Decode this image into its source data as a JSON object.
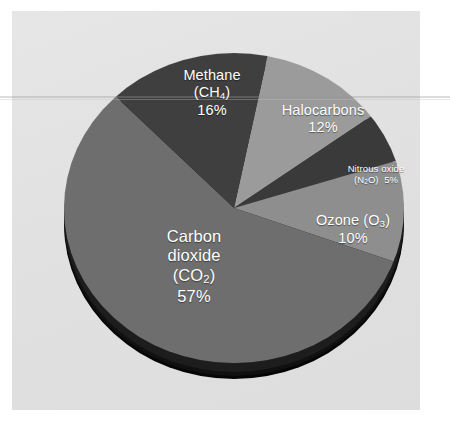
{
  "figure": {
    "background_panel_color": "#e3e3e3",
    "page_color": "#ffffff"
  },
  "chart_data": {
    "type": "pie",
    "title": "",
    "subtitle": "",
    "xlabel": "",
    "ylabel": "",
    "legend_position": "none",
    "grid": false,
    "style": "3d-pie-with-depth",
    "categories": [
      "Halocarbons",
      "Nitrous oxide (N2O)",
      "Ozone (O3)",
      "Carbon dioxide (CO2)",
      "Methane (CH4)"
    ],
    "values": [
      12,
      5,
      10,
      57,
      16
    ],
    "units": "percent",
    "colors": [
      "#9b9b9b",
      "#3a3a3a",
      "#8e8e8e",
      "#6e6e6e",
      "#3f3f3f"
    ],
    "slices": [
      {
        "name": "Halocarbons",
        "value": 12,
        "value_label": "12%",
        "label_lines": [
          "Halocarbons",
          "12%"
        ],
        "color": "#9b9b9b",
        "start_deg": 12,
        "end_deg": 55.2
      },
      {
        "name": "Nitrous oxide",
        "value": 5,
        "value_label": "5%",
        "label_lines": [
          "Nitrous oxide",
          "(N2O)  5%"
        ],
        "color": "#3a3a3a",
        "start_deg": 55.2,
        "end_deg": 73.2
      },
      {
        "name": "Ozone",
        "value": 10,
        "value_label": "10%",
        "label_lines": [
          "Ozone (O3)",
          "10%"
        ],
        "color": "#8e8e8e",
        "start_deg": 73.2,
        "end_deg": 109.2
      },
      {
        "name": "Carbon dioxide",
        "value": 57,
        "value_label": "57%",
        "label_lines": [
          "Carbon",
          "dioxide",
          "(CO2)",
          "57%"
        ],
        "color": "#6e6e6e",
        "start_deg": 109.2,
        "end_deg": 314.4
      },
      {
        "name": "Methane",
        "value": 16,
        "value_label": "16%",
        "label_lines": [
          "Methane",
          "(CH4)",
          "16%"
        ],
        "color": "#3f3f3f",
        "start_deg": 314.4,
        "end_deg": 372
      }
    ]
  },
  "labels": {
    "methane": {
      "line1": "Methane",
      "line2_pre": "(CH",
      "line2_sub": "4",
      "line2_post": ")",
      "line3": "16%"
    },
    "halocarbons": {
      "line1": "Halocarbons",
      "line2": "12%"
    },
    "nitrous_oxide": {
      "line1": "Nitrous oxide",
      "line2_pre": "(N",
      "line2_sub": "2",
      "line2_post": "O)",
      "line2_value": "5%"
    },
    "ozone": {
      "line1_pre": "Ozone (O",
      "line1_sub": "3",
      "line1_post": ")",
      "line2": "10%"
    },
    "carbon_dioxide": {
      "line1": "Carbon",
      "line2": "dioxide",
      "line3_pre": "(CO",
      "line3_sub": "2",
      "line3_post": ")",
      "line4": "57%"
    }
  }
}
